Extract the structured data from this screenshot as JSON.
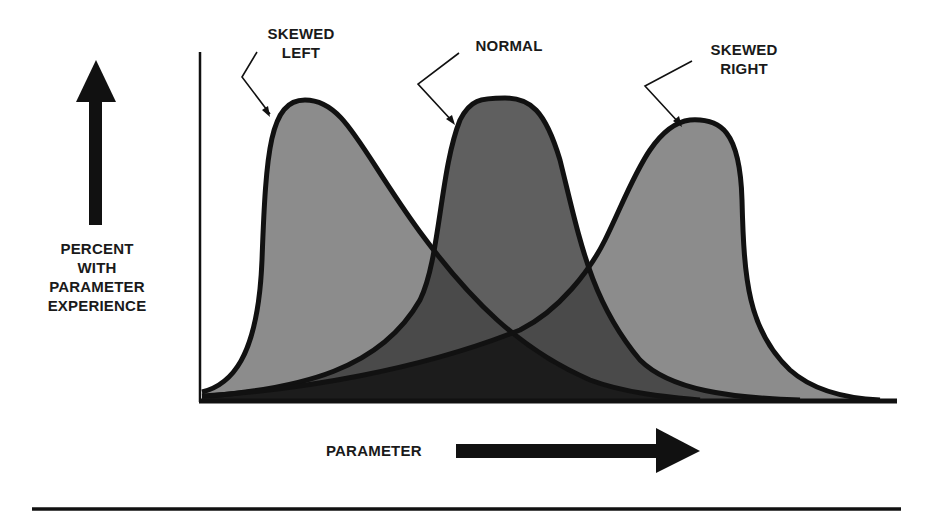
{
  "diagram": {
    "curves": [
      {
        "id": "skewed-left",
        "label_lines": [
          "SKEWED",
          "LEFT"
        ],
        "fill": "#8c8c8c"
      },
      {
        "id": "normal",
        "label_lines": [
          "NORMAL"
        ],
        "fill": "#5f5f5f"
      },
      {
        "id": "skewed-right",
        "label_lines": [
          "SKEWED",
          "RIGHT"
        ],
        "fill": "#8c8c8c"
      }
    ],
    "overlap_colors": {
      "pair": "#4a4a4a",
      "triple": "#1c1c1c"
    },
    "y_axis": {
      "label_lines": [
        "PERCENT",
        "WITH",
        "PARAMETER",
        "EXPERIENCE"
      ],
      "arrow_direction": "up"
    },
    "x_axis": {
      "label": "PARAMETER",
      "arrow_direction": "right"
    },
    "colors": {
      "stroke": "#111111",
      "background": "#ffffff"
    }
  }
}
